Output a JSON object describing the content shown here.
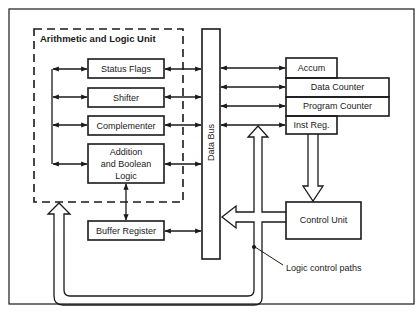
{
  "diagram": {
    "alu": {
      "title": "Arithmetic and Logic Unit",
      "blocks": [
        "Status Flags",
        "Shifter",
        "Complementer",
        "Addition and Boolean Logic"
      ],
      "addition_lines": [
        "Addition",
        "and Boolean",
        "Logic"
      ]
    },
    "buffer_register": "Buffer Register",
    "data_bus": "Data Bus",
    "registers": {
      "accum": "Accum",
      "data_counter": "Data Counter",
      "program_counter": "Program Counter",
      "inst_reg": "Inst Reg."
    },
    "control_unit": "Control Unit",
    "annotation": "Logic control paths",
    "colors": {
      "line": "#1a1a1a",
      "background": "#ffffff"
    }
  }
}
